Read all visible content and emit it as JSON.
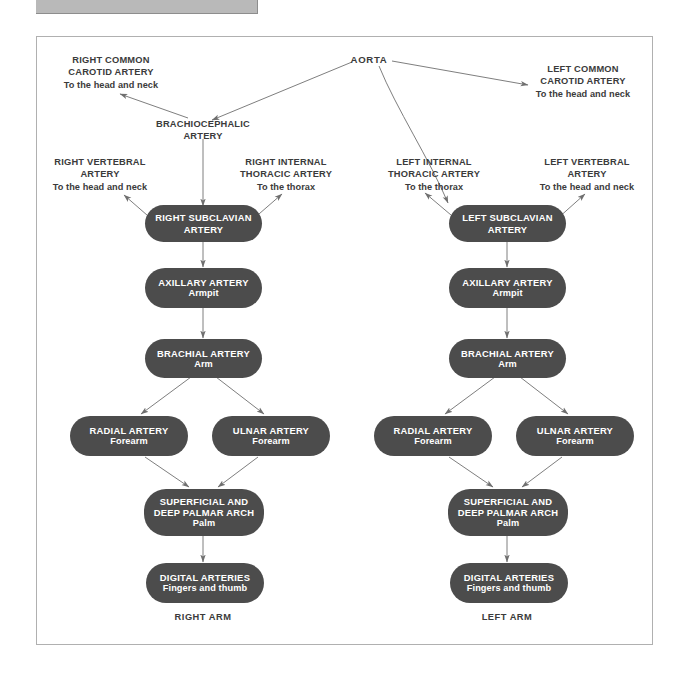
{
  "figure": {
    "root": {
      "label": "AORTA"
    },
    "branch_labels": [
      {
        "id": "right-common-carotid",
        "title": "RIGHT COMMON\nCAROTID ARTERY",
        "line1": "RIGHT COMMON",
        "line2": "CAROTID ARTERY",
        "sub": "To the head and neck"
      },
      {
        "id": "left-common-carotid",
        "title": "LEFT COMMON\nCAROTID ARTERY",
        "line1": "LEFT COMMON",
        "line2": "CAROTID ARTERY",
        "sub": "To the head and neck"
      },
      {
        "id": "brachiocephalic",
        "line1": "BRACHIOCEPHALIC",
        "line2": "ARTERY",
        "sub": ""
      },
      {
        "id": "right-vertebral",
        "line1": "RIGHT VERTEBRAL",
        "line2": "ARTERY",
        "sub": "To the head and neck"
      },
      {
        "id": "right-internal-thoracic",
        "line1": "RIGHT INTERNAL",
        "line2": "THORACIC ARTERY",
        "sub": "To the thorax"
      },
      {
        "id": "left-internal-thoracic",
        "line1": "LEFT INTERNAL",
        "line2": "THORACIC ARTERY",
        "sub": "To the thorax"
      },
      {
        "id": "left-vertebral",
        "line1": "LEFT VERTEBRAL",
        "line2": "ARTERY",
        "sub": "To the head and neck"
      }
    ],
    "right_arm": {
      "footer": "RIGHT ARM",
      "nodes": [
        {
          "id": "right-subclavian",
          "line1": "RIGHT SUBCLAVIAN",
          "line2": "ARTERY",
          "sub": ""
        },
        {
          "id": "right-axillary",
          "line1": "AXILLARY ARTERY",
          "line2": "",
          "sub": "Armpit"
        },
        {
          "id": "right-brachial",
          "line1": "BRACHIAL ARTERY",
          "line2": "",
          "sub": "Arm"
        },
        {
          "id": "right-radial",
          "line1": "RADIAL ARTERY",
          "line2": "",
          "sub": "Forearm"
        },
        {
          "id": "right-ulnar",
          "line1": "ULNAR ARTERY",
          "line2": "",
          "sub": "Forearm"
        },
        {
          "id": "right-palmar-arch",
          "line1": "SUPERFICIAL AND",
          "line2": "DEEP PALMAR ARCH",
          "sub": "Palm"
        },
        {
          "id": "right-digital",
          "line1": "DIGITAL ARTERIES",
          "line2": "",
          "sub": "Fingers and thumb"
        }
      ]
    },
    "left_arm": {
      "footer": "LEFT ARM",
      "nodes": [
        {
          "id": "left-subclavian",
          "line1": "LEFT SUBCLAVIAN",
          "line2": "ARTERY",
          "sub": ""
        },
        {
          "id": "left-axillary",
          "line1": "AXILLARY ARTERY",
          "line2": "",
          "sub": "Armpit"
        },
        {
          "id": "left-brachial",
          "line1": "BRACHIAL ARTERY",
          "line2": "",
          "sub": "Arm"
        },
        {
          "id": "left-radial",
          "line1": "RADIAL ARTERY",
          "line2": "",
          "sub": "Forearm"
        },
        {
          "id": "left-ulnar",
          "line1": "ULNAR ARTERY",
          "line2": "",
          "sub": "Forearm"
        },
        {
          "id": "left-palmar-arch",
          "line1": "SUPERFICIAL AND",
          "line2": "DEEP PALMAR ARCH",
          "sub": "Palm"
        },
        {
          "id": "left-digital",
          "line1": "DIGITAL ARTERIES",
          "line2": "",
          "sub": "Fingers and thumb"
        }
      ]
    },
    "colors": {
      "node_fill": "#4c4c4c",
      "node_text": "#ffffff",
      "label_text": "#3b3b3b",
      "connector": "#6f6f6f",
      "frame_border": "#b0b0b0",
      "top_bar": "#b9b9b9"
    }
  }
}
